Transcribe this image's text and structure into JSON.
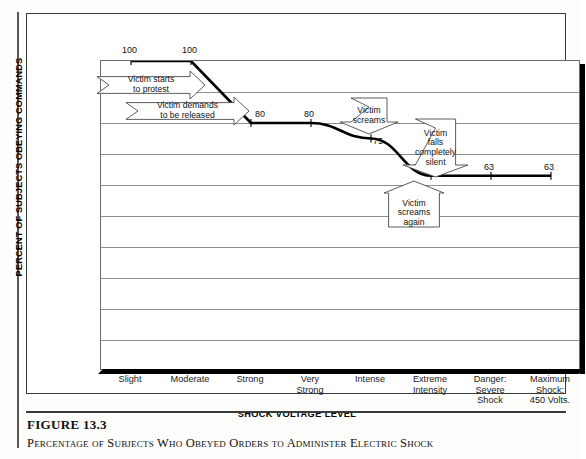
{
  "figure": {
    "number": "FIGURE 13.3",
    "caption": "Percentage of Subjects Who Obeyed Orders to Administer Electric Shock"
  },
  "chart_data": {
    "type": "line",
    "title": "",
    "xlabel": "SHOCK VOLTAGE LEVEL",
    "ylabel": "PERCENT OF SUBJECTS OBEYING COMMANDS",
    "categories": [
      "Slight",
      "Moderate",
      "Strong",
      "Very\nStrong",
      "Intense",
      "Extreme\nIntensity",
      "Danger:\nSevere\nShock",
      "Maximum\nShock:\n450 Volts."
    ],
    "values": [
      100,
      100,
      80,
      80,
      75,
      63,
      63,
      63
    ],
    "point_labels": [
      "100",
      "100",
      "80",
      "80",
      "75",
      "63",
      "63",
      "63"
    ],
    "ylim": [
      0,
      100
    ],
    "ytick_labels": [
      "100",
      "90",
      "80",
      "70",
      "60",
      "50",
      "40",
      "30",
      "20",
      "10",
      "0"
    ],
    "ytick_values": [
      100,
      90,
      80,
      70,
      60,
      50,
      40,
      30,
      20,
      10,
      0
    ],
    "grid": true,
    "legend": "none",
    "line_color": "#000000",
    "grid_color": "#8e8e8e",
    "annotations": [
      {
        "id": "victim-starts-to-protest",
        "text": "Victim starts\nto protest",
        "shape": "right-arrow"
      },
      {
        "id": "victim-demands-release",
        "text": "Victim demands\nto be released",
        "shape": "right-arrow"
      },
      {
        "id": "victim-screams",
        "text": "Victim\nscreams",
        "shape": "down-arrow"
      },
      {
        "id": "victim-falls-completely-silent",
        "text": "Victim\nfalls\ncompletely\nsilent",
        "shape": "down-arrow"
      },
      {
        "id": "victim-screams-again",
        "text": "Victim\nscreams\nagain",
        "shape": "up-arrow"
      }
    ]
  }
}
